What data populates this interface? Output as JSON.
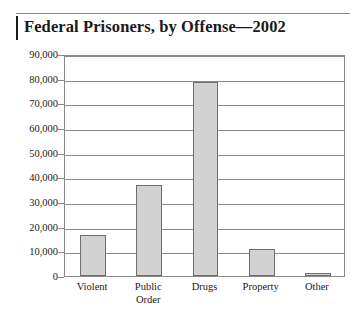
{
  "chart_data": {
    "type": "bar",
    "title": "Federal Prisoners, by Offense—2002",
    "xlabel": "",
    "ylabel": "",
    "categories": [
      "Violent",
      "Public Order",
      "Drugs",
      "Property",
      "Other"
    ],
    "category_lines": [
      [
        "Violent"
      ],
      [
        "Public",
        "Order"
      ],
      [
        "Drugs"
      ],
      [
        "Property"
      ],
      [
        "Other"
      ]
    ],
    "values": [
      16500,
      37000,
      78500,
      11000,
      1200
    ],
    "ylim": [
      0,
      90000
    ],
    "ytick_values": [
      0,
      10000,
      20000,
      30000,
      40000,
      50000,
      60000,
      70000,
      80000,
      90000
    ],
    "ytick_labels": [
      "0",
      "10,000",
      "20,000",
      "30,000",
      "40,000",
      "50,000",
      "60,000",
      "70,000",
      "80,000",
      "90,000"
    ],
    "grid": true,
    "legend": false,
    "bar_color": "#d2d2d2",
    "bar_border_color": "#6e6e6e",
    "axis_color": "#8a8a8a",
    "text_color": "#1a1a1a"
  }
}
